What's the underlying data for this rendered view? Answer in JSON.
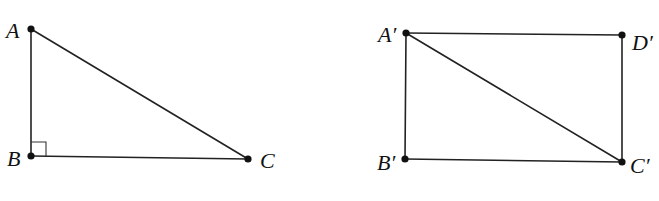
{
  "figures": [
    {
      "name": "right-triangle-ABC",
      "shape": "triangle",
      "points": {
        "A": {
          "label": "A",
          "x": 31,
          "y": 29
        },
        "B": {
          "label": "B",
          "x": 31,
          "y": 156
        },
        "C": {
          "label": "C",
          "x": 248,
          "y": 159
        }
      },
      "segments": [
        [
          "A",
          "B"
        ],
        [
          "B",
          "C"
        ],
        [
          "A",
          "C"
        ]
      ],
      "right_angle_at": "B"
    },
    {
      "name": "rectangle-A'B'C'D'",
      "shape": "rectangle",
      "points": {
        "A'": {
          "label": "A′",
          "x": 406,
          "y": 33
        },
        "B'": {
          "label": "B′",
          "x": 405,
          "y": 159
        },
        "C'": {
          "label": "C′",
          "x": 622,
          "y": 162
        },
        "D'": {
          "label": "D′",
          "x": 622,
          "y": 35
        }
      },
      "segments": [
        [
          "A'",
          "D'"
        ],
        [
          "D'",
          "C'"
        ],
        [
          "C'",
          "B'"
        ],
        [
          "B'",
          "A'"
        ],
        [
          "A'",
          "C'"
        ]
      ],
      "diagonal": [
        "A'",
        "C'"
      ]
    }
  ],
  "labels": {
    "A": "A",
    "B": "B",
    "C": "C",
    "A_prime": "A′",
    "B_prime": "B′",
    "C_prime": "C′",
    "D_prime": "D′"
  },
  "colors": {
    "stroke": "#222222",
    "background": "#ffffff"
  }
}
